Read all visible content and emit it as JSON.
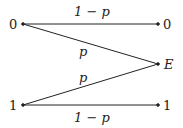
{
  "diagram": {
    "type": "binary-erasure-channel",
    "inputs": [
      "0",
      "1"
    ],
    "outputs": [
      "0",
      "E",
      "1"
    ],
    "edges": [
      {
        "from": "0",
        "to": "0",
        "label": "1 − p"
      },
      {
        "from": "0",
        "to": "E",
        "label": "p"
      },
      {
        "from": "1",
        "to": "E",
        "label": "p"
      },
      {
        "from": "1",
        "to": "1",
        "label": "1 − p"
      }
    ]
  }
}
